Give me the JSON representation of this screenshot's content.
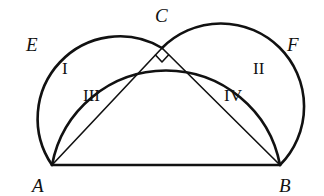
{
  "diagram": {
    "type": "geometry",
    "points": {
      "A": {
        "label": "A",
        "x": 52,
        "y": 165
      },
      "B": {
        "label": "B",
        "x": 280,
        "y": 165
      },
      "C": {
        "label": "C",
        "x": 162,
        "y": 48
      },
      "E": {
        "label": "E"
      },
      "F": {
        "label": "F"
      }
    },
    "regions": {
      "I": "I",
      "II": "II",
      "III": "III",
      "IV": "IV"
    },
    "right_angle_at": "C",
    "stroke_color": "#111111",
    "background": "#ffffff"
  }
}
